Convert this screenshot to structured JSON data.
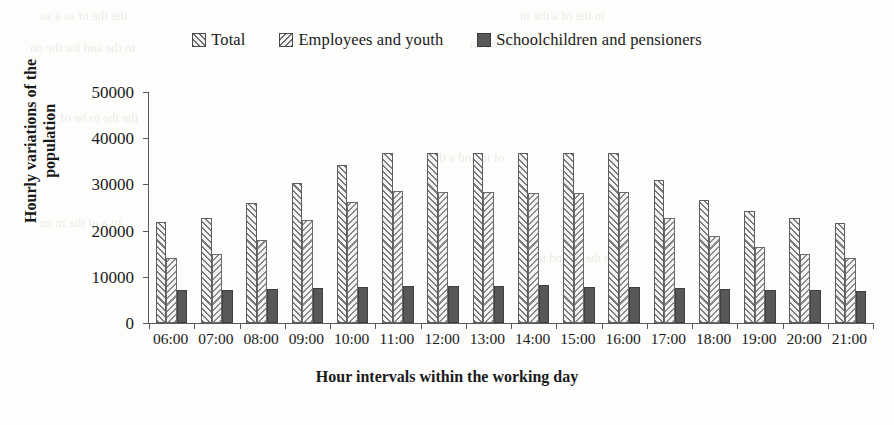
{
  "chart_data": {
    "type": "bar",
    "title": "",
    "xlabel": "Hour intervals within the working day",
    "ylabel": "Hourly variations of the population",
    "ylim": [
      0,
      50000
    ],
    "ytick_values": [
      50000,
      40000,
      30000,
      20000,
      10000,
      0
    ],
    "ytick_labels": [
      "50000",
      "40000",
      "30000",
      "20000",
      "10000",
      "0"
    ],
    "grid": false,
    "legend_position": "top-center",
    "categories": [
      "06:00",
      "07:00",
      "08:00",
      "09:00",
      "10:00",
      "11:00",
      "12:00",
      "13:00",
      "14:00",
      "15:00",
      "16:00",
      "17:00",
      "18:00",
      "19:00",
      "20:00",
      "21:00"
    ],
    "series": [
      {
        "name": "Total",
        "pattern": "forward-diagonal-hatch",
        "color": "#7a7a7a",
        "values": [
          21800,
          22800,
          26000,
          30300,
          34100,
          36800,
          36900,
          36800,
          36800,
          36700,
          36700,
          31000,
          26700,
          24200,
          22700,
          21700
        ]
      },
      {
        "name": "Employees and youth",
        "pattern": "backward-diagonal-hatch",
        "color": "#8a8a8a",
        "values": [
          14100,
          15000,
          18000,
          22400,
          26100,
          28500,
          28400,
          28300,
          28200,
          28200,
          28400,
          22800,
          18900,
          16400,
          14900,
          14000
        ]
      },
      {
        "name": "Schoolchildren and pensioners",
        "pattern": "solid",
        "color": "#585858",
        "values": [
          7100,
          7200,
          7400,
          7600,
          7800,
          8000,
          8100,
          8100,
          8200,
          7900,
          7800,
          7600,
          7300,
          7200,
          7100,
          7000
        ]
      }
    ]
  },
  "legend": {
    "items": [
      {
        "label": "Total",
        "key": "hatch-forward-key"
      },
      {
        "label": "Employees and youth",
        "key": "hatch-backward-key"
      },
      {
        "label": "Schoolchildren and pensioners",
        "key": "solid-key"
      }
    ]
  },
  "bleed_text": [
    "the the of as a so",
    "in the of a the in",
    "to the and for the on",
    "is of to and the an",
    "the the to be of",
    "of in and a the",
    "to a of the in an",
    "a the of and to be"
  ]
}
